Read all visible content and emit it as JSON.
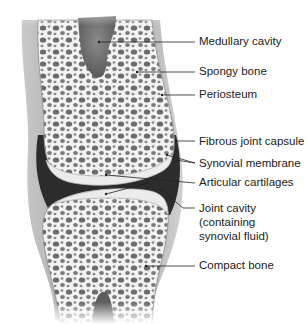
{
  "diagram": {
    "labels": [
      {
        "id": "medullary-cavity",
        "text": "Medullary cavity",
        "x": 199,
        "y": 35
      },
      {
        "id": "spongy-bone",
        "text": "Spongy bone",
        "x": 199,
        "y": 65
      },
      {
        "id": "periosteum",
        "text": "Periosteum",
        "x": 199,
        "y": 88
      },
      {
        "id": "fibrous-joint-capsule",
        "text": "Fibrous joint capsule",
        "x": 199,
        "y": 135
      },
      {
        "id": "synovial-membrane",
        "text": "Synovial membrane",
        "x": 199,
        "y": 157
      },
      {
        "id": "articular-cartilages",
        "text": "Articular cartilages",
        "x": 199,
        "y": 176
      },
      {
        "id": "joint-cavity",
        "text": "Joint cavity",
        "x": 199,
        "y": 202
      },
      {
        "id": "joint-cavity-line2",
        "text": "(containing",
        "x": 199,
        "y": 216
      },
      {
        "id": "joint-cavity-line3",
        "text": "synovial fluid)",
        "x": 199,
        "y": 230
      },
      {
        "id": "compact-bone",
        "text": "Compact bone",
        "x": 199,
        "y": 259
      }
    ],
    "colors": {
      "bone_fill": "#f2f2f2",
      "pore": "#6e6e6e",
      "capsule": "#a8a8a8",
      "cavity": "#2a2a2a",
      "marrow": "#7a7a7a",
      "leader": "#222222"
    }
  }
}
